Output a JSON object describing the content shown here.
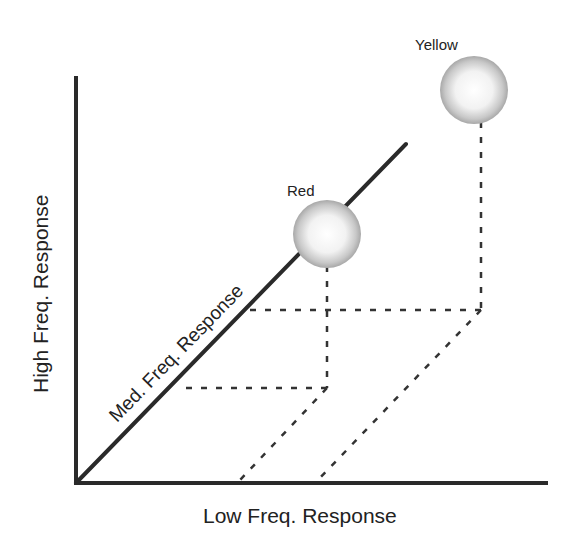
{
  "diagram": {
    "type": "3d-axis-color-space",
    "axes": {
      "x_label": "Low Freq. Response",
      "y_label": "High Freq. Response",
      "z_label": "Med. Freq. Response"
    },
    "points": [
      {
        "label": "Red",
        "color": "gray-sphere"
      },
      {
        "label": "Yellow",
        "color": "gray-sphere"
      }
    ],
    "colors": {
      "axis": "#2a2a2a",
      "dotted": "#333333",
      "sphere_edge": "#9a9a9a",
      "sphere_center": "#ffffff"
    }
  }
}
